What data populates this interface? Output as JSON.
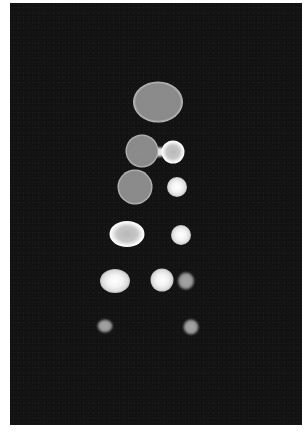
{
  "image": {
    "description": "Grayscale microscopy-style image of bright ring-shaped and solid spots arranged in rows on a dark background",
    "colors": {
      "background": "#121212",
      "spot_fill": "#8a8a8a",
      "spot_rim": "#f0f0f0",
      "frame": "#ffffff"
    },
    "spots": [
      {
        "id": "spot-1",
        "row": 1,
        "cx": 158,
        "cy": 102,
        "w": 50,
        "h": 41,
        "style": "ring"
      },
      {
        "id": "spot-2",
        "row": 2,
        "cx": 142,
        "cy": 151,
        "w": 33,
        "h": 33,
        "style": "ring"
      },
      {
        "id": "spot-3",
        "row": 2,
        "cx": 173,
        "cy": 152,
        "w": 23,
        "h": 23,
        "style": "ringbright"
      },
      {
        "id": "spot-4",
        "row": 3,
        "cx": 135,
        "cy": 187,
        "w": 35,
        "h": 35,
        "style": "ring"
      },
      {
        "id": "spot-5",
        "row": 3,
        "cx": 177,
        "cy": 187,
        "w": 20,
        "h": 20,
        "style": "bright"
      },
      {
        "id": "spot-6",
        "row": 4,
        "cx": 127,
        "cy": 234,
        "w": 35,
        "h": 26,
        "style": "ringbright"
      },
      {
        "id": "spot-7",
        "row": 4,
        "cx": 181,
        "cy": 235,
        "w": 20,
        "h": 20,
        "style": "bright"
      },
      {
        "id": "spot-8",
        "row": 5,
        "cx": 115,
        "cy": 281,
        "w": 30,
        "h": 24,
        "style": "bright"
      },
      {
        "id": "spot-9",
        "row": 5,
        "cx": 162,
        "cy": 280,
        "w": 23,
        "h": 23,
        "style": "bright"
      },
      {
        "id": "spot-10",
        "row": 5,
        "cx": 186,
        "cy": 281,
        "w": 16,
        "h": 17,
        "style": "dim"
      },
      {
        "id": "spot-11",
        "row": 6,
        "cx": 105,
        "cy": 326,
        "w": 15,
        "h": 13,
        "style": "dim"
      },
      {
        "id": "spot-12",
        "row": 6,
        "cx": 191,
        "cy": 327,
        "w": 15,
        "h": 15,
        "style": "dim"
      }
    ],
    "bridges": [
      {
        "id": "bridge-2-3",
        "cx": 159,
        "cy": 152,
        "w": 12,
        "h": 9
      }
    ]
  }
}
